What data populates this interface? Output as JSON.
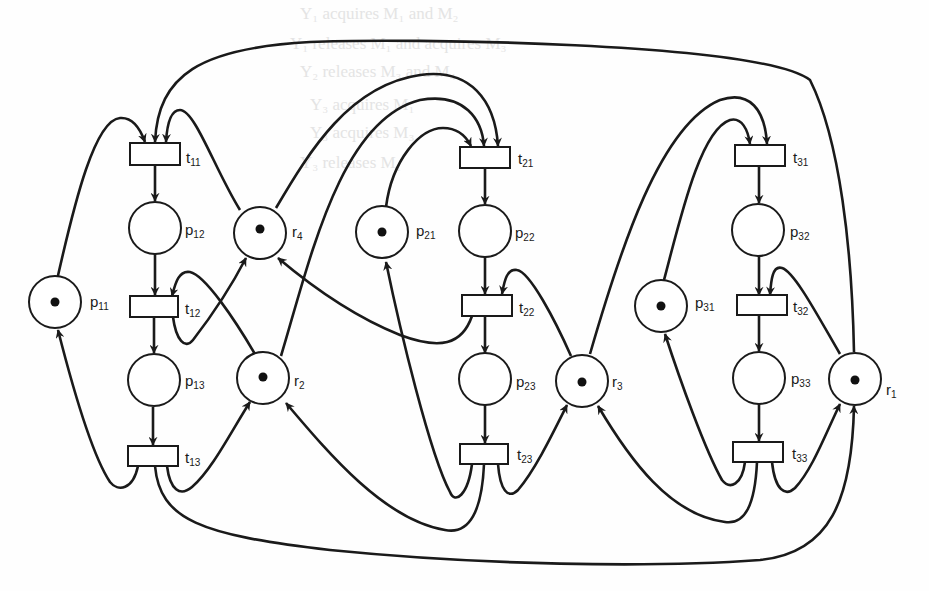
{
  "diagram": {
    "type": "petri-net",
    "colors": {
      "stroke": "#1a1a1a",
      "background": "#fefefe",
      "token": "#111111"
    },
    "background_text": [
      "Y₁ acquires M₁ and M₂",
      "Y₁ releases M₁ and acquires M₃",
      "Y₂ releases M₃ and M₄",
      "Y₃ acquires M₁",
      "Y₃ acquires M₃",
      "Y₃ releases M₁"
    ],
    "places": [
      {
        "id": "p11",
        "base": "p",
        "sub": "11",
        "tokens": 1
      },
      {
        "id": "p12",
        "base": "p",
        "sub": "12",
        "tokens": 0
      },
      {
        "id": "p13",
        "base": "p",
        "sub": "13",
        "tokens": 0
      },
      {
        "id": "p21",
        "base": "p",
        "sub": "21",
        "tokens": 1
      },
      {
        "id": "p22",
        "base": "p",
        "sub": "22",
        "tokens": 0
      },
      {
        "id": "p23",
        "base": "p",
        "sub": "23",
        "tokens": 0
      },
      {
        "id": "p31",
        "base": "p",
        "sub": "31",
        "tokens": 1
      },
      {
        "id": "p32",
        "base": "p",
        "sub": "32",
        "tokens": 0
      },
      {
        "id": "p33",
        "base": "p",
        "sub": "33",
        "tokens": 0
      },
      {
        "id": "r1",
        "base": "r",
        "sub": "1",
        "tokens": 1
      },
      {
        "id": "r2",
        "base": "r",
        "sub": "2",
        "tokens": 1
      },
      {
        "id": "r3",
        "base": "r",
        "sub": "3",
        "tokens": 1
      },
      {
        "id": "r4",
        "base": "r",
        "sub": "4",
        "tokens": 1
      }
    ],
    "transitions": [
      {
        "id": "t11",
        "base": "t",
        "sub": "11"
      },
      {
        "id": "t12",
        "base": "t",
        "sub": "12"
      },
      {
        "id": "t13",
        "base": "t",
        "sub": "13"
      },
      {
        "id": "t21",
        "base": "t",
        "sub": "21"
      },
      {
        "id": "t22",
        "base": "t",
        "sub": "22"
      },
      {
        "id": "t23",
        "base": "t",
        "sub": "23"
      },
      {
        "id": "t31",
        "base": "t",
        "sub": "31"
      },
      {
        "id": "t32",
        "base": "t",
        "sub": "32"
      },
      {
        "id": "t33",
        "base": "t",
        "sub": "33"
      }
    ],
    "arcs": [
      [
        "p11",
        "t11"
      ],
      [
        "r1",
        "t11"
      ],
      [
        "r4",
        "t11"
      ],
      [
        "t11",
        "p12"
      ],
      [
        "p12",
        "t12"
      ],
      [
        "r2",
        "t12"
      ],
      [
        "t12",
        "r4"
      ],
      [
        "t12",
        "p13"
      ],
      [
        "p13",
        "t13"
      ],
      [
        "t13",
        "p11"
      ],
      [
        "t13",
        "r2"
      ],
      [
        "t13",
        "r1"
      ],
      [
        "p21",
        "t21"
      ],
      [
        "r4",
        "t21"
      ],
      [
        "r2",
        "t21"
      ],
      [
        "t21",
        "p22"
      ],
      [
        "p22",
        "t22"
      ],
      [
        "r3",
        "t22"
      ],
      [
        "t22",
        "r4"
      ],
      [
        "t22",
        "p23"
      ],
      [
        "p23",
        "t23"
      ],
      [
        "t23",
        "p21"
      ],
      [
        "t23",
        "r2"
      ],
      [
        "t23",
        "r3"
      ],
      [
        "p31",
        "t31"
      ],
      [
        "r3",
        "t31"
      ],
      [
        "t31",
        "p32"
      ],
      [
        "p32",
        "t32"
      ],
      [
        "r1",
        "t32"
      ],
      [
        "t32",
        "p33"
      ],
      [
        "p33",
        "t33"
      ],
      [
        "t33",
        "p31"
      ],
      [
        "t33",
        "r3"
      ],
      [
        "t33",
        "r1"
      ]
    ]
  }
}
